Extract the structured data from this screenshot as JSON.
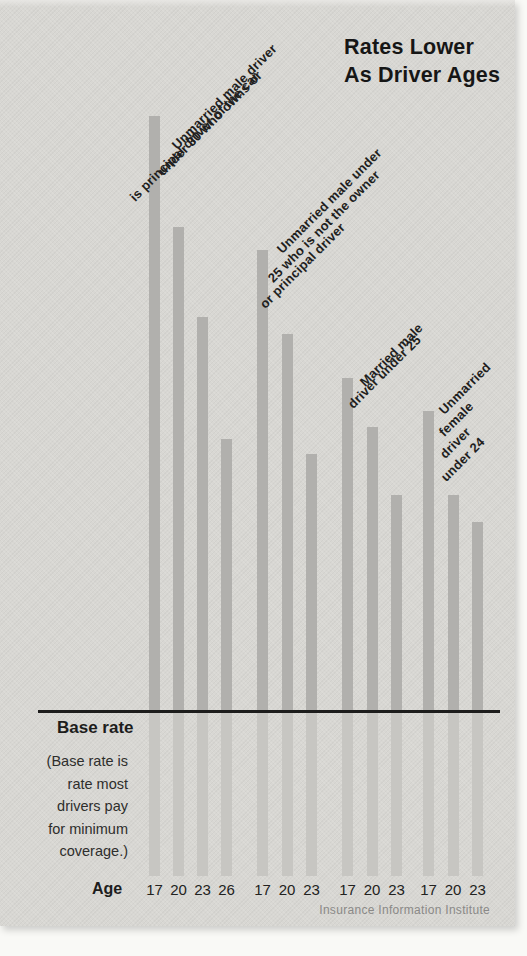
{
  "title": {
    "line1": "Rates Lower",
    "line2": "As Driver Ages"
  },
  "base_rate": {
    "label": "Base rate",
    "note": "(Base rate is\nrate most\ndrivers pay\nfor minimum\ncoverage.)"
  },
  "age_axis_label": "Age",
  "source": "Insurance Information Institute",
  "chart_data": {
    "type": "bar",
    "title": "Rates Lower As Driver Ages",
    "xlabel": "Age",
    "baseline_label": "Base rate",
    "baseline_note": "(Base rate is rate most drivers pay for minimum coverage.)",
    "source": "Insurance Information Institute",
    "units": "estimated multiple of base rate; chart prints no numeric axis, baseline = 1.0 = base rate, values read from bar heights",
    "groups": [
      {
        "label": "Unmarried male driver under 30 who owns or is principal driver of the car",
        "label_lines": [
          "Unmarried male driver",
          "under 30 who owns or",
          "is principal driver of the car"
        ],
        "ages": [
          "17",
          "20",
          "23",
          "26"
        ],
        "values": [
          4.63,
          3.95,
          3.4,
          2.66
        ]
      },
      {
        "label": "Unmarried male under 25 who is not the owner or principal driver",
        "label_lines": [
          "Unmarried male under",
          "25 who is not the owner",
          "or principal driver"
        ],
        "ages": [
          "17",
          "20",
          "23"
        ],
        "values": [
          3.81,
          3.3,
          2.57
        ]
      },
      {
        "label": "Married male driver under 25",
        "label_lines": [
          "Married male",
          "driver under 25"
        ],
        "ages": [
          "17",
          "20",
          "23"
        ],
        "values": [
          3.03,
          2.73,
          2.32
        ]
      },
      {
        "label": "Unmarried female driver under 24",
        "label_lines": [
          "Unmarried",
          "female",
          "driver",
          "under 24"
        ],
        "ages": [
          "17",
          "20",
          "23"
        ],
        "values": [
          2.83,
          2.32,
          2.15
        ]
      }
    ],
    "colors": {
      "bar": "#b1b0ad",
      "bar_below_baseline": "#c7c6c2",
      "paper": "#d8d7d3",
      "text": "#1f1f1e",
      "source_text": "#8a8987"
    }
  }
}
